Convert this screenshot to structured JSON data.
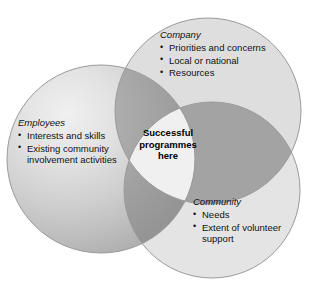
{
  "diagram": {
    "type": "venn",
    "canvas": {
      "width": 322,
      "height": 294,
      "background": "#ffffff"
    },
    "colors": {
      "circle_light": "#dedede",
      "circle_light_alt": "#e4e4e4",
      "pair_overlap": "#a3a3a3",
      "triple_overlap": "#f0f0f0",
      "outline": "#9a9a9a",
      "text": "#111111"
    },
    "circles": [
      {
        "id": "employees",
        "cx": 101,
        "cy": 159,
        "r": 94,
        "fill": "gradient-sphere"
      },
      {
        "id": "company",
        "cx": 208,
        "cy": 111,
        "r": 93,
        "fill": "#dedede"
      },
      {
        "id": "community",
        "cx": 212,
        "cy": 190,
        "r": 88,
        "fill": "#e4e4e4"
      }
    ]
  },
  "groups": {
    "employees": {
      "heading": "Employees",
      "items": [
        "Interests and skills",
        "Existing community involvement activities"
      ]
    },
    "company": {
      "heading": "Company",
      "items": [
        "Priorities and concerns",
        "Local or national",
        "Resources"
      ]
    },
    "community": {
      "heading": "Community",
      "items": [
        "Needs",
        "Extent of volunteer support"
      ]
    }
  },
  "center": {
    "line1": "Successful",
    "line2": "programmes",
    "line3": "here"
  }
}
